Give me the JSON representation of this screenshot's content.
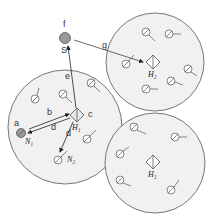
{
  "diagram": {
    "type": "network-cluster-diagram",
    "source_node": {
      "label": "S",
      "top_label": "f",
      "fill": "#9a9a9a"
    },
    "clusters": [
      {
        "id": "left",
        "hub_label": "H1",
        "hub_display": "H₁"
      },
      {
        "id": "top-right",
        "hub_label": "H2",
        "hub_display": "H₂"
      },
      {
        "id": "bottom-right",
        "hub_label": "H3",
        "hub_display": "H₃"
      }
    ],
    "special_nodes": [
      {
        "label": "N1",
        "display": "N₁",
        "fill": "#9a9a9a"
      },
      {
        "label": "N2",
        "display": "N₂",
        "fill": "#ffffff"
      }
    ],
    "edges": [
      {
        "label": "a",
        "desc": "label near N1 node"
      },
      {
        "label": "b",
        "from": "N1",
        "to": "H1"
      },
      {
        "label": "c",
        "desc": "label beside H1"
      },
      {
        "label": "d",
        "from": "H1",
        "to": "N1"
      },
      {
        "label": "d",
        "from": "H1",
        "to": "N2"
      },
      {
        "label": "e",
        "from": "H1",
        "to": "S"
      },
      {
        "label": "f",
        "desc": "label above S"
      },
      {
        "label": "g",
        "from": "S",
        "to": "H2"
      }
    ],
    "colors": {
      "cluster_fill": "#f1f1f1",
      "stroke": "#555555",
      "node_fill": "#ffffff"
    }
  }
}
